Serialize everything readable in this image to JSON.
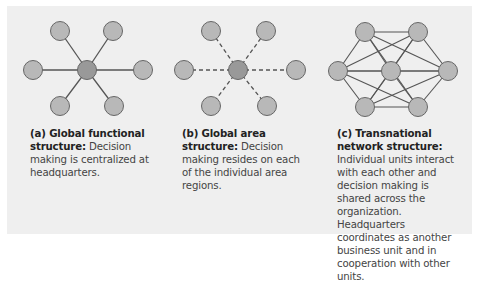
{
  "colors": {
    "background": "#ffffff",
    "panel": "#efefef",
    "node_outer_fill": "#b8b8b8",
    "node_center_fill": "#999999",
    "node_stroke": "#666666",
    "edge": "#555555",
    "title_text": "#222222",
    "body_text": "#444444"
  },
  "diagrams": [
    {
      "id": "a",
      "edge_style": "solid",
      "topology": "star",
      "caption_title": "(a) Global functional structure:",
      "caption_body": " Decision making is centralized at headquarters."
    },
    {
      "id": "b",
      "edge_style": "dashed",
      "topology": "star",
      "caption_title": "(b) Global area structure:",
      "caption_body": " Decision making resides on each of the individual area regions."
    },
    {
      "id": "c",
      "edge_style": "solid",
      "topology": "full-mesh",
      "caption_title": "(c) Transnational network structure:",
      "caption_body": "  Individual units interact with each other and decision making is shared across the organization. Headquarters coordinates as another business unit and in cooperation with other units."
    }
  ]
}
